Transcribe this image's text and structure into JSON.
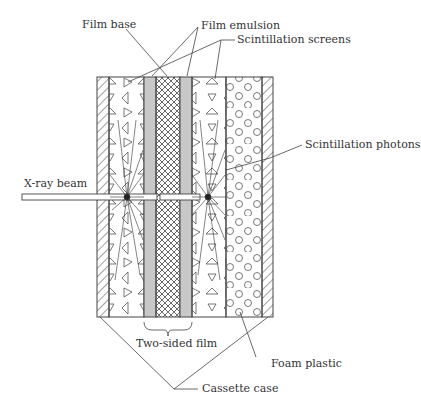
{
  "diagram": {
    "labels": {
      "film_base": "Film base",
      "film_emulsion": "Film emulsion",
      "scintillation_screens": "Scintillation screens",
      "scintillation_photons": "Scintillation photons",
      "xray_beam": "X-ray beam",
      "two_sided_film": "Two-sided film",
      "foam_plastic": "Foam plastic",
      "cassette_case": "Cassette case"
    },
    "layers": [
      {
        "name": "cassette-case-left",
        "pattern": "diagonal-hatch"
      },
      {
        "name": "scintillation-screen-left",
        "pattern": "triangles"
      },
      {
        "name": "film-emulsion-left",
        "pattern": "gray-fill",
        "color": "#c8c8c8"
      },
      {
        "name": "film-base",
        "pattern": "crosshatch"
      },
      {
        "name": "film-emulsion-right",
        "pattern": "gray-fill",
        "color": "#c8c8c8"
      },
      {
        "name": "scintillation-screen-right",
        "pattern": "triangles"
      },
      {
        "name": "foam-plastic",
        "pattern": "circles"
      },
      {
        "name": "cassette-case-right",
        "pattern": "diagonal-hatch"
      }
    ]
  }
}
